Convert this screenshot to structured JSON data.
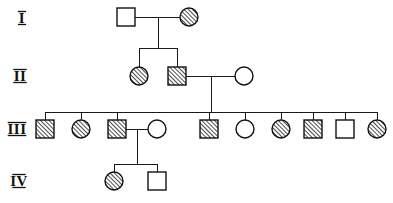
{
  "figure": {
    "type": "pedigree-chart",
    "title": "",
    "background_color": "#ffffff",
    "line_color": "#1a1a1a",
    "symbol_stroke_color": "#111111",
    "affected_fill": "diagonal-hatch",
    "unaffected_fill": "#ffffff",
    "width": 393,
    "height": 203
  },
  "legend_key": {
    "square": "male",
    "circle": "female",
    "hatched": "affected",
    "open": "unaffected"
  },
  "generation_labels": [
    {
      "id": "gen-label-1",
      "text": "I",
      "x": 22,
      "y": 23
    },
    {
      "id": "gen-label-2",
      "text": "II",
      "x": 20,
      "y": 81
    },
    {
      "id": "gen-label-3",
      "text": "III",
      "x": 17,
      "y": 134
    },
    {
      "id": "gen-label-4",
      "text": "IV",
      "x": 19,
      "y": 186
    }
  ],
  "generations": [
    {
      "roman": "I",
      "row_y": 17,
      "individuals": [
        {
          "id": "I-1",
          "sex": "male",
          "shape": "square",
          "affected": false,
          "cx": 126,
          "cy": 17
        },
        {
          "id": "I-2",
          "sex": "female",
          "shape": "circle",
          "affected": true,
          "cx": 189,
          "cy": 17
        }
      ]
    },
    {
      "roman": "II",
      "row_y": 76,
      "individuals": [
        {
          "id": "II-1",
          "sex": "female",
          "shape": "circle",
          "affected": true,
          "cx": 139,
          "cy": 76
        },
        {
          "id": "II-2",
          "sex": "male",
          "shape": "square",
          "affected": true,
          "cx": 177,
          "cy": 76
        },
        {
          "id": "II-3",
          "sex": "female",
          "shape": "circle",
          "affected": false,
          "cx": 244,
          "cy": 76
        }
      ]
    },
    {
      "roman": "III",
      "row_y": 129,
      "individuals": [
        {
          "id": "III-1",
          "sex": "male",
          "shape": "square",
          "affected": true,
          "cx": 45,
          "cy": 129
        },
        {
          "id": "III-2",
          "sex": "female",
          "shape": "circle",
          "affected": true,
          "cx": 81,
          "cy": 129
        },
        {
          "id": "III-3",
          "sex": "male",
          "shape": "square",
          "affected": true,
          "cx": 117,
          "cy": 129
        },
        {
          "id": "III-4",
          "sex": "female",
          "shape": "circle",
          "affected": false,
          "cx": 157,
          "cy": 129
        },
        {
          "id": "III-5",
          "sex": "male",
          "shape": "square",
          "affected": true,
          "cx": 209,
          "cy": 129
        },
        {
          "id": "III-6",
          "sex": "female",
          "shape": "circle",
          "affected": false,
          "cx": 245,
          "cy": 129
        },
        {
          "id": "III-7",
          "sex": "female",
          "shape": "circle",
          "affected": true,
          "cx": 281,
          "cy": 129
        },
        {
          "id": "III-8",
          "sex": "male",
          "shape": "square",
          "affected": true,
          "cx": 313,
          "cy": 129
        },
        {
          "id": "III-9",
          "sex": "male",
          "shape": "square",
          "affected": false,
          "cx": 345,
          "cy": 129
        },
        {
          "id": "III-10",
          "sex": "female",
          "shape": "circle",
          "affected": true,
          "cx": 377,
          "cy": 129
        }
      ]
    },
    {
      "roman": "IV",
      "row_y": 181,
      "individuals": [
        {
          "id": "IV-1",
          "sex": "female",
          "shape": "circle",
          "affected": true,
          "cx": 114,
          "cy": 181
        },
        {
          "id": "IV-2",
          "sex": "male",
          "shape": "square",
          "affected": false,
          "cx": 157,
          "cy": 181
        }
      ]
    }
  ],
  "matings": [
    {
      "id": "mating-I",
      "partners": [
        "I-1",
        "I-2"
      ],
      "line_y": 17,
      "x1": 135,
      "x2": 180,
      "drop_x": 158,
      "drop_to": 48
    },
    {
      "id": "mating-II",
      "partners": [
        "II-2",
        "II-3"
      ],
      "line_y": 76,
      "x1": 186,
      "x2": 235,
      "drop_x": 211,
      "drop_to": 112
    },
    {
      "id": "mating-III-3",
      "partners": [
        "III-3",
        "III-4"
      ],
      "line_y": 129,
      "x1": 126,
      "x2": 148,
      "drop_x": 137,
      "drop_to": 164
    }
  ],
  "sibships": [
    {
      "id": "sibship-II",
      "parents": "mating-I",
      "bar_y": 48,
      "bar_x1": 139,
      "bar_x2": 177,
      "children": [
        "II-1",
        "II-2"
      ]
    },
    {
      "id": "sibship-III",
      "parents": "mating-II",
      "bar_y": 112,
      "bar_x1": 45,
      "bar_x2": 377,
      "children": [
        "III-1",
        "III-2",
        "III-3",
        "III-5",
        "III-6",
        "III-7",
        "III-8",
        "III-9",
        "III-10"
      ]
    },
    {
      "id": "sibship-IV",
      "parents": "mating-III-3",
      "bar_y": 164,
      "bar_x1": 114,
      "bar_x2": 157,
      "children": [
        "IV-1",
        "IV-2"
      ]
    }
  ],
  "counts": {
    "total_individuals": 17,
    "affected": 11,
    "unaffected": 6,
    "generations": 4
  }
}
